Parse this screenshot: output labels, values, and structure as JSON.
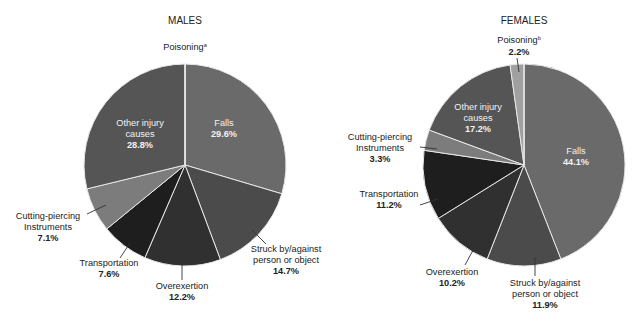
{
  "chart_data": [
    {
      "type": "pie",
      "title": "MALES",
      "start_angle_deg": 0,
      "direction": "clockwise",
      "slices": [
        {
          "label": "Falls",
          "value": 29.6,
          "display": "29.6%",
          "color": "#6a6a6a"
        },
        {
          "label": "Struck by/against person or object",
          "value": 14.7,
          "display": "14.7%",
          "color": "#4b4b4b"
        },
        {
          "label": "Overexertion",
          "value": 12.2,
          "display": "12.2%",
          "color": "#303030"
        },
        {
          "label": "Transportation",
          "value": 7.6,
          "display": "7.6%",
          "color": "#1e1e1e"
        },
        {
          "label": "Cutting-piercing Instruments",
          "value": 7.1,
          "display": "7.1%",
          "color": "#7c7c7c"
        },
        {
          "label": "Other injury causes",
          "value": 28.8,
          "display": "28.8%",
          "color": "#555555"
        },
        {
          "label": "Poisoning",
          "value": 0.0,
          "display": "",
          "footnote": "a",
          "color": "#a0a0a0"
        }
      ]
    },
    {
      "type": "pie",
      "title": "FEMALES",
      "start_angle_deg": 0,
      "direction": "clockwise",
      "slices": [
        {
          "label": "Falls",
          "value": 44.1,
          "display": "44.1%",
          "color": "#6a6a6a"
        },
        {
          "label": "Struck by/against person or object",
          "value": 11.9,
          "display": "11.9%",
          "color": "#4b4b4b"
        },
        {
          "label": "Overexertion",
          "value": 10.2,
          "display": "10.2%",
          "color": "#303030"
        },
        {
          "label": "Transportation",
          "value": 11.2,
          "display": "11.2%",
          "color": "#1e1e1e"
        },
        {
          "label": "Cutting-piercing Instruments",
          "value": 3.3,
          "display": "3.3%",
          "color": "#7c7c7c"
        },
        {
          "label": "Other injury causes",
          "value": 17.2,
          "display": "17.2%",
          "color": "#555555"
        },
        {
          "label": "Poisoning",
          "value": 2.2,
          "display": "2.2%",
          "footnote": "b",
          "color": "#a0a0a0"
        }
      ]
    }
  ],
  "males": {
    "title": "MALES",
    "poisoning": {
      "label": "Poisoning",
      "footnote": "a"
    },
    "other": {
      "line1": "Other injury",
      "line2": "causes",
      "value": "28.8%"
    },
    "falls": {
      "label": "Falls",
      "value": "29.6%"
    },
    "cutting": {
      "line1": "Cutting-piercing",
      "line2": "Instruments",
      "value": "7.1%"
    },
    "transportation": {
      "label": "Transportation",
      "value": "7.6%"
    },
    "overexertion": {
      "label": "Overexertion",
      "value": "12.2%"
    },
    "struck": {
      "line1": "Struck by/against",
      "line2": "person or object",
      "value": "14.7%"
    }
  },
  "females": {
    "title": "FEMALES",
    "poisoning": {
      "label": "Poisoning",
      "footnote": "b",
      "value": "2.2%"
    },
    "other": {
      "line1": "Other injury",
      "line2": "causes",
      "value": "17.2%"
    },
    "falls": {
      "label": "Falls",
      "value": "44.1%"
    },
    "cutting": {
      "line1": "Cutting-piercing",
      "line2": "Instruments",
      "value": "3.3%"
    },
    "transportation": {
      "label": "Transportation",
      "value": "11.2%"
    },
    "overexertion": {
      "label": "Overexertion",
      "value": "10.2%"
    },
    "struck": {
      "line1": "Struck by/against",
      "line2": "person or object",
      "value": "11.9%"
    }
  }
}
